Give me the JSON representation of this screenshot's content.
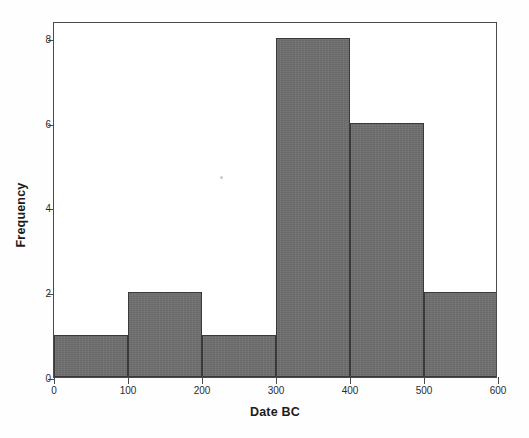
{
  "chart_data": {
    "type": "bar",
    "title": "",
    "subtitle": "",
    "xlabel": "Date BC",
    "ylabel": "Frequency",
    "xlim": [
      0,
      600
    ],
    "ylim": [
      0,
      8.4
    ],
    "bin_width": 100,
    "grid": false,
    "legend": null,
    "categories": [
      "0-100",
      "100-200",
      "200-300",
      "300-400",
      "400-500",
      "500-600"
    ],
    "bin_edges": [
      0,
      100,
      200,
      300,
      400,
      500,
      600
    ],
    "values": [
      1,
      2,
      1,
      8,
      6,
      2
    ],
    "xticks": [
      0,
      100,
      200,
      300,
      400,
      500,
      600
    ],
    "xtick_labels": [
      "0",
      "100",
      "200",
      "300",
      "400",
      "500",
      "600"
    ],
    "yticks": [
      0,
      2,
      4,
      6,
      8
    ],
    "ytick_labels": [
      "0",
      "2",
      "4",
      "6",
      "8"
    ],
    "bar_color": "#6e6e6e",
    "bar_edge_color": "#3a3a3a",
    "axis_color": "#4a4a4a",
    "background_color": "#ffffff"
  }
}
